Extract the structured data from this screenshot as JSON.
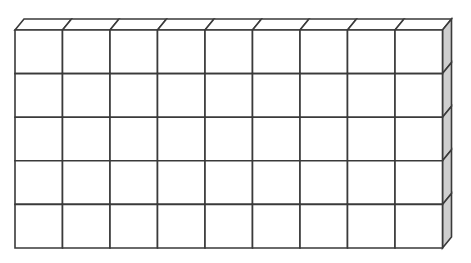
{
  "figure": {
    "name": "cube-block-grid",
    "description": "Rectangular block built from unit cubes drawn in oblique projection",
    "columns": 9,
    "rows": 5,
    "depth_layers": 1,
    "total_visible_cubes": 45,
    "colors": {
      "outline": "#3a3a3a",
      "front_face": "#ffffff",
      "top_face": "#ffffff",
      "side_face": "#cfcfcf",
      "background": "#ffffff"
    },
    "geometry": {
      "origin_x": 15,
      "origin_y": 30,
      "cell_width": 47.5,
      "cell_height": 43.6,
      "depth_dx": 9,
      "depth_dy": -11
    }
  },
  "chart_data": {
    "type": "diagram",
    "title": "",
    "subtitle": "",
    "xlabel": "",
    "ylabel": "",
    "categories": [],
    "values": [],
    "grid_columns": 9,
    "grid_rows": 5,
    "cube_count": 45,
    "annotations": []
  }
}
